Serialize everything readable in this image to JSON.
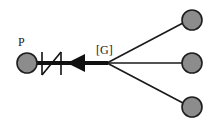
{
  "diagram": {
    "type": "network",
    "colors": {
      "node_fill": "#8c8c8c",
      "node_stroke": "#1e1e1e",
      "edge": "#1a1a1a",
      "background": "#ffffff"
    },
    "source_node": {
      "id": "P",
      "label": "P",
      "cx": 27,
      "cy": 63,
      "r": 10
    },
    "hub": {
      "label": "[G]",
      "x": 107,
      "y": 63
    },
    "trunk": {
      "from": "P",
      "to": "hub",
      "symbols": [
        "zigzag-break",
        "arrowhead-left"
      ]
    },
    "leaf_nodes": [
      {
        "id": "leaf-top",
        "cx": 192,
        "cy": 20,
        "r": 10
      },
      {
        "id": "leaf-middle",
        "cx": 192,
        "cy": 63,
        "r": 10
      },
      {
        "id": "leaf-bottom",
        "cx": 192,
        "cy": 107,
        "r": 10
      }
    ]
  }
}
